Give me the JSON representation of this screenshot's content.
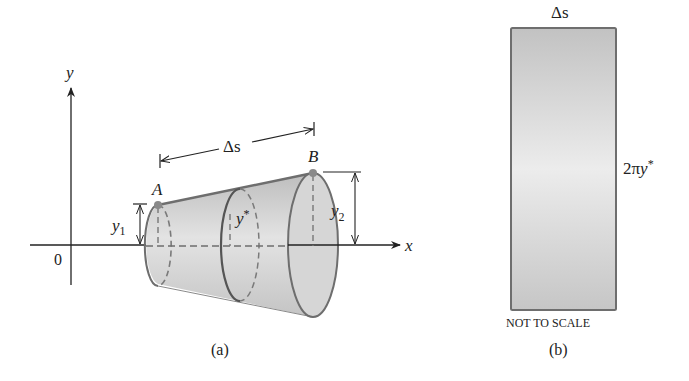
{
  "figure_a": {
    "caption": "(a)",
    "axis_x_label": "x",
    "axis_y_label": "y",
    "origin_label": "0",
    "point_a_label": "A",
    "point_b_label": "B",
    "delta_s_label": "Δs",
    "y1_label": "y",
    "y1_sub": "1",
    "y2_label": "y",
    "y2_sub": "2",
    "ystar_label": "y",
    "ystar_sup": "*"
  },
  "figure_b": {
    "caption": "(b)",
    "top_label": "Δs",
    "side_label_prefix": "2π",
    "side_label_var": "y",
    "side_label_sup": "*",
    "note": "NOT TO SCALE"
  },
  "colors": {
    "surface_fill": "#c9c9c9",
    "outline": "#6e6e6e",
    "point": "#8a8a8a",
    "axis": "#222222"
  }
}
